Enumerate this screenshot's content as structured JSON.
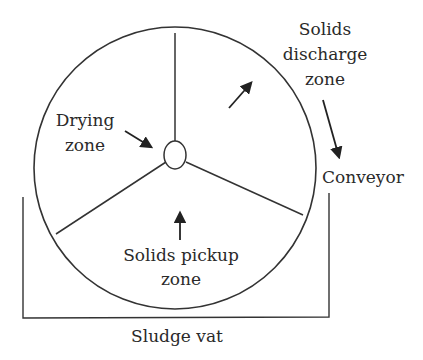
{
  "diagram": {
    "colors": {
      "stroke": "#333333",
      "text": "#2a2a2a",
      "background": "#ffffff"
    },
    "labels": {
      "discharge_line1": "Solids",
      "discharge_line2": "discharge",
      "discharge_line3": "zone",
      "drying_line1": "Drying",
      "drying_line2": "zone",
      "conveyor": "Conveyor",
      "pickup_line1": "Solids pickup",
      "pickup_line2": "zone",
      "vat": "Sludge vat"
    },
    "nodes": [
      {
        "id": "drum",
        "shape": "circle",
        "cx": 175,
        "cy": 168,
        "r": 141
      },
      {
        "id": "hub",
        "shape": "ellipse",
        "cx": 175,
        "cy": 155,
        "rx": 11,
        "ry": 14
      },
      {
        "id": "vat",
        "shape": "open-box",
        "x1": 23,
        "x2": 329,
        "top": 195,
        "bottom": 318
      }
    ],
    "edges": [
      {
        "from": "hub",
        "to": "drum-top",
        "type": "spoke"
      },
      {
        "from": "hub",
        "to": "drum-lower-left",
        "type": "spoke"
      },
      {
        "from": "hub",
        "to": "drum-lower-right",
        "type": "spoke"
      },
      {
        "from": "drying-label",
        "to": "hub",
        "type": "arrow"
      },
      {
        "from": "drum-interior",
        "to": "discharge-zone",
        "type": "arrow",
        "meaning": "rotation direction"
      },
      {
        "from": "discharge-label",
        "to": "conveyor",
        "type": "arrow"
      },
      {
        "from": "pickup-label",
        "to": "drum-interior",
        "type": "arrow"
      }
    ]
  }
}
